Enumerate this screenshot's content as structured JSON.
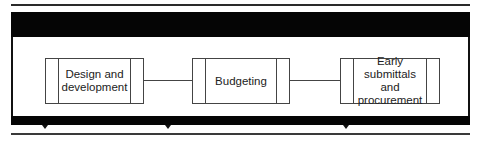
{
  "diagram": {
    "type": "process-flow",
    "steps": [
      {
        "label": "Design and\ndevelopment"
      },
      {
        "label": "Budgeting"
      },
      {
        "label": "Early submittals\nand\nprocurement"
      }
    ],
    "connections": [
      {
        "from": 0,
        "to": 1
      },
      {
        "from": 1,
        "to": 2
      }
    ],
    "colors": {
      "bar": "#050505",
      "box_border": "#444444",
      "text": "#222222",
      "background": "#ffffff"
    }
  }
}
